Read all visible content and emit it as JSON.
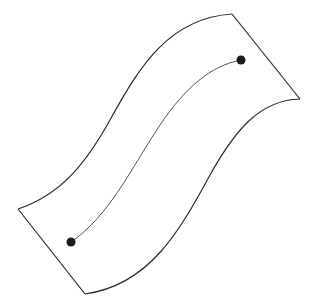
{
  "diagram": {
    "kind": "curved surface with path between two points",
    "colors": {
      "background": "#ffffff",
      "surface_outline": "#2a2a2a",
      "path": "#555555",
      "points": "#1a1a1a"
    },
    "surface": {
      "top_edge": "M18,209 C60,195 85,165 110,120 C140,65 170,18 232,14",
      "right_edge": "M232,14 L300,99",
      "bottom_edge": "M300,99 C260,100 235,130 210,175 C180,230 150,285 85,294",
      "left_edge": "M85,294 L18,209"
    },
    "path": "M71,242 C110,215 130,170 160,125 C185,88 210,66 241,60",
    "points": [
      {
        "id": "start-point",
        "cx": 71,
        "cy": 242,
        "r": 4.5
      },
      {
        "id": "end-point",
        "cx": 241,
        "cy": 60,
        "r": 4.5
      }
    ]
  }
}
